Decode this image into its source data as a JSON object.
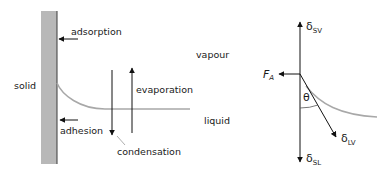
{
  "diagram": {
    "left_panel": {
      "regions": {
        "solid": "solid",
        "vapour": "vapour",
        "liquid": "liquid"
      },
      "processes": {
        "adsorption": "adsorption",
        "adhesion": "adhesion",
        "evaporation": "evaporation",
        "condensation": "condensation"
      }
    },
    "right_panel": {
      "force_label": "F",
      "force_sub": "A",
      "angle_label": "θ",
      "tensions": [
        {
          "symbol": "δ",
          "sub": "SV",
          "direction": "up"
        },
        {
          "symbol": "δ",
          "sub": "LV",
          "direction": "down-right"
        },
        {
          "symbol": "δ",
          "sub": "SL",
          "direction": "down"
        }
      ]
    },
    "colors": {
      "solid_fill": "#b8b8b8",
      "solid_edge": "#3a3a3a",
      "meniscus": "#a8a8a8",
      "arrow": "#111111"
    }
  }
}
